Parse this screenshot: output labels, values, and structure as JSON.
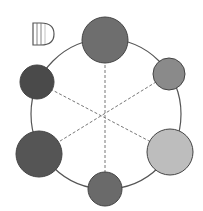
{
  "label": "D",
  "diagram": {
    "type": "hexagonal-ring-of-circles",
    "ring": {
      "cx": 106,
      "cy": 114,
      "r": 75,
      "stroke": "#555555"
    },
    "center": {
      "x": 107,
      "y": 116
    },
    "circles": [
      {
        "id": "top",
        "cx": 105,
        "cy": 40,
        "r": 23,
        "fill": "#6e6e6e"
      },
      {
        "id": "upper-right",
        "cx": 169,
        "cy": 74,
        "r": 16,
        "fill": "#8a8a8a"
      },
      {
        "id": "lower-right",
        "cx": 170,
        "cy": 152,
        "r": 23,
        "fill": "#bdbdbd"
      },
      {
        "id": "bottom",
        "cx": 105,
        "cy": 189,
        "r": 17,
        "fill": "#6a6a6a"
      },
      {
        "id": "lower-left",
        "cx": 39,
        "cy": 154,
        "r": 23,
        "fill": "#555555"
      },
      {
        "id": "upper-left",
        "cx": 37,
        "cy": 82,
        "r": 17,
        "fill": "#4a4a4a"
      }
    ],
    "dashed_lines": [
      {
        "from": "top",
        "to": "bottom"
      },
      {
        "from": "upper-left",
        "to": "lower-right"
      },
      {
        "from": "upper-right",
        "to": "lower-left"
      }
    ]
  }
}
